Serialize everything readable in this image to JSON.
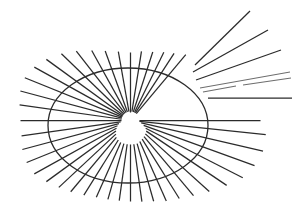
{
  "figure": {
    "canvas": {
      "width": 295,
      "height": 217,
      "background_color": "#ffffff"
    },
    "line_color": "#2b2b2b",
    "faint_line_color": "#6d6d6d",
    "ellipse": {
      "name": "ellipse-outline",
      "center_x": 128,
      "center_y": 125.5,
      "radius_x": 80,
      "radius_y": 57.5,
      "stroke_width": 1.3
    },
    "hub": {
      "x": 130.5,
      "y": 120.5
    },
    "inner_void_radius": 7
  },
  "chart_data": {
    "type": "scatter",
    "xlabel": "",
    "ylabel": "",
    "xlim": [
      0,
      295
    ],
    "ylim": [
      0,
      217
    ],
    "grid": false,
    "legend": "none",
    "series": [
      {
        "name": "attached-rays",
        "comment": "rays emanating from the hub at (130.5,120.5); angle in degrees measured counter-clockwise from +x axis in screen space, r0 = inner start radius, r1 = outer end radius",
        "hub": [
          130.5,
          120.5
        ],
        "rays": [
          {
            "angle": 90,
            "r0": 8,
            "r1": 68
          },
          {
            "angle": 81,
            "r0": 9,
            "r1": 70
          },
          {
            "angle": 72,
            "r0": 9,
            "r1": 72
          },
          {
            "angle": 64,
            "r0": 9,
            "r1": 76
          },
          {
            "angle": 57,
            "r0": 9,
            "r1": 80
          },
          {
            "angle": 50,
            "r0": 9,
            "r1": 86
          },
          {
            "angle": 100,
            "r0": 9,
            "r1": 70
          },
          {
            "angle": 110,
            "r0": 9,
            "r1": 74
          },
          {
            "angle": 119,
            "r0": 9,
            "r1": 80
          },
          {
            "angle": 128,
            "r0": 9,
            "r1": 88
          },
          {
            "angle": 136,
            "r0": 9,
            "r1": 96
          },
          {
            "angle": 144,
            "r0": 9,
            "r1": 104
          },
          {
            "angle": 151,
            "r0": 9,
            "r1": 110
          },
          {
            "angle": 158,
            "r0": 9,
            "r1": 114
          },
          {
            "angle": 165,
            "r0": 9,
            "r1": 114
          },
          {
            "angle": 172,
            "r0": 9,
            "r1": 112
          },
          {
            "angle": 180,
            "r0": 9,
            "r1": 110
          },
          {
            "angle": 188,
            "r0": 10,
            "r1": 110
          },
          {
            "angle": 195,
            "r0": 12,
            "r1": 112
          },
          {
            "angle": 202,
            "r0": 14,
            "r1": 112
          },
          {
            "angle": 209,
            "r0": 16,
            "r1": 110
          },
          {
            "angle": 216,
            "r0": 18,
            "r1": 104
          },
          {
            "angle": 223,
            "r0": 20,
            "r1": 98
          },
          {
            "angle": 230,
            "r0": 22,
            "r1": 93
          },
          {
            "angle": 238,
            "r0": 23,
            "r1": 88
          },
          {
            "angle": 246,
            "r0": 24,
            "r1": 84
          },
          {
            "angle": 254,
            "r0": 24,
            "r1": 82
          },
          {
            "angle": 262,
            "r0": 24,
            "r1": 81
          },
          {
            "angle": 270,
            "r0": 24,
            "r1": 81
          },
          {
            "angle": 278,
            "r0": 24,
            "r1": 82
          },
          {
            "angle": 286,
            "r0": 24,
            "r1": 84
          },
          {
            "angle": 294,
            "r0": 23,
            "r1": 88
          },
          {
            "angle": 302,
            "r0": 22,
            "r1": 92
          },
          {
            "angle": 310,
            "r0": 21,
            "r1": 98
          },
          {
            "angle": 318,
            "r0": 20,
            "r1": 106
          },
          {
            "angle": 326,
            "r0": 19,
            "r1": 116
          },
          {
            "angle": 333,
            "r0": 17,
            "r1": 126
          },
          {
            "angle": 340,
            "r0": 14,
            "r1": 132
          },
          {
            "angle": 347,
            "r0": 11,
            "r1": 136
          },
          {
            "angle": 354,
            "r0": 9,
            "r1": 136
          },
          {
            "angle": 0,
            "r0": 9,
            "r1": 130
          }
        ]
      },
      {
        "name": "detached-upper-right-rays",
        "comment": "fan of long rays in the upper right that do not reach the hub; x1,y1 -> x2,y2 in image pixels",
        "segments": [
          {
            "x1": 195,
            "y1": 65,
            "x2": 250,
            "y2": 11,
            "faint": false
          },
          {
            "x1": 193,
            "y1": 72,
            "x2": 268,
            "y2": 30,
            "faint": false
          },
          {
            "x1": 196,
            "y1": 80,
            "x2": 281,
            "y2": 50,
            "faint": false
          },
          {
            "x1": 200,
            "y1": 88,
            "x2": 290,
            "y2": 72,
            "faint": true
          },
          {
            "x1": 203,
            "y1": 92,
            "x2": 236,
            "y2": 86,
            "faint": true
          },
          {
            "x1": 243,
            "y1": 85,
            "x2": 291,
            "y2": 78,
            "faint": true
          },
          {
            "x1": 208,
            "y1": 98,
            "x2": 292,
            "y2": 98,
            "faint": false
          }
        ]
      }
    ]
  }
}
